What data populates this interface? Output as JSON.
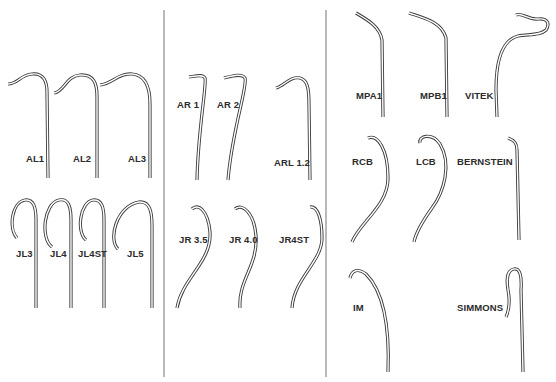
{
  "figure": {
    "colors": {
      "stroke": "#3a3a3a",
      "divider": "#8a8a8a",
      "background": "#ffffff"
    },
    "groups": [
      {
        "name": "Left panel",
        "catheters": [
          {
            "label": "AL1"
          },
          {
            "label": "AL2"
          },
          {
            "label": "AL3"
          },
          {
            "label": "JL3"
          },
          {
            "label": "JL4"
          },
          {
            "label": "JL4ST"
          },
          {
            "label": "JL5"
          }
        ]
      },
      {
        "name": "Middle panel",
        "catheters": [
          {
            "label": "AR 1"
          },
          {
            "label": "AR 2"
          },
          {
            "label": "ARL 1.2"
          },
          {
            "label": "JR 3.5"
          },
          {
            "label": "JR 4.0"
          },
          {
            "label": "JR4ST"
          }
        ]
      },
      {
        "name": "Right panel",
        "catheters": [
          {
            "label": "MPA1"
          },
          {
            "label": "MPB1"
          },
          {
            "label": "VITEK"
          },
          {
            "label": "RCB"
          },
          {
            "label": "LCB"
          },
          {
            "label": "BERNSTEIN"
          },
          {
            "label": "IM"
          },
          {
            "label": "SIMMONS"
          }
        ]
      }
    ]
  }
}
